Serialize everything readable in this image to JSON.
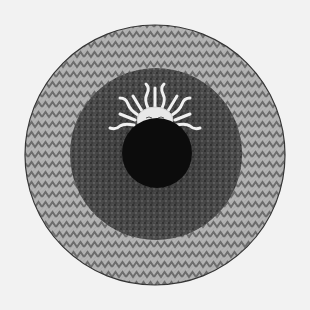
{
  "image": {
    "description": "Engraving of concentric circles: outer zigzag-hatched light ring, dark textured middle ring, black central disc with a sun face rising above it",
    "colors": {
      "paper": "#f2f2f2",
      "outer_ring": "#a8a8a8",
      "outer_ring_pattern": "#6e6e6e",
      "middle_ring": "#4a4a4a",
      "middle_ring_texture": "#2e2e2e",
      "core": "#0c0c0c",
      "sun": "#f0f0f0",
      "outline": "#333333"
    },
    "geometry": {
      "center": [
        155,
        155
      ],
      "outer_radius": 130,
      "middle_radius": 86,
      "core_center": [
        157,
        153
      ],
      "core_radius": 35,
      "sun_center": [
        155,
        117
      ]
    }
  }
}
